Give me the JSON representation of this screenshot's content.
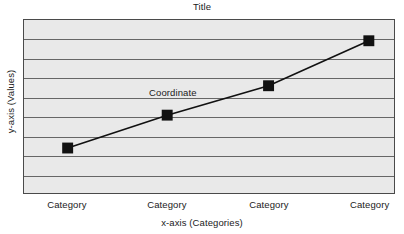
{
  "chart_data": {
    "type": "line",
    "title": "Title",
    "xlabel": "x-axis (Categories)",
    "ylabel": "y-axis (Values)",
    "categories": [
      "Category",
      "Category",
      "Category",
      "Category"
    ],
    "values": [
      0.26,
      0.45,
      0.62,
      0.88
    ],
    "ylim": [
      0,
      1
    ],
    "grid": true,
    "gridline_count": 8,
    "legend": null,
    "annotations": [
      {
        "text": "Coordinate",
        "x": 0.4,
        "y": 0.59
      }
    ],
    "series": [
      {
        "name": "Coordinate",
        "values": [
          0.26,
          0.45,
          0.62,
          0.88
        ],
        "marker": "square",
        "marker_color": "#111111",
        "line_color": "#111111"
      }
    ],
    "xtick_positions": [
      0.118,
      0.387,
      0.661,
      0.932
    ],
    "plot_background": "#e9e9e9",
    "gridline_color": "#666666",
    "border_color": "#4a4a4a"
  }
}
